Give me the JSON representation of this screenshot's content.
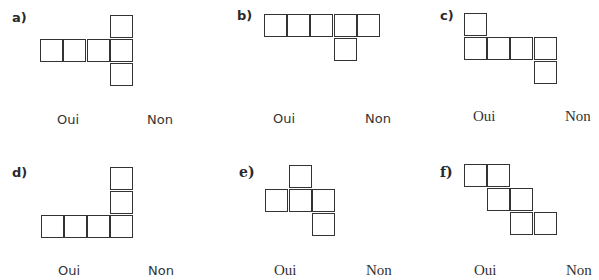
{
  "exercises": [
    {
      "label": "a)",
      "yes": "Oui",
      "no": "Non"
    },
    {
      "label": "b)",
      "yes": "Oui",
      "no": "Non"
    },
    {
      "label": "c)",
      "yes": "Oui",
      "no": "Non"
    },
    {
      "label": "d)",
      "yes": "Oui",
      "no": "Non"
    },
    {
      "label": "e)",
      "yes": "Oui",
      "no": "Non"
    },
    {
      "label": "f)",
      "yes": "Oui",
      "no": "Non"
    }
  ],
  "nets": {
    "a": [
      [
        110,
        15
      ],
      [
        40,
        39
      ],
      [
        63,
        39
      ],
      [
        87,
        39
      ],
      [
        110,
        39
      ],
      [
        110,
        63
      ]
    ],
    "b": [
      [
        264,
        14
      ],
      [
        287,
        14
      ],
      [
        310,
        14
      ],
      [
        334,
        14
      ],
      [
        357,
        14
      ],
      [
        334,
        38
      ]
    ],
    "c": [
      [
        464,
        13
      ],
      [
        464,
        37
      ],
      [
        487,
        37
      ],
      [
        510,
        37
      ],
      [
        534,
        37
      ],
      [
        534,
        61
      ]
    ],
    "d": [
      [
        110,
        167
      ],
      [
        110,
        191
      ],
      [
        41,
        215
      ],
      [
        64,
        215
      ],
      [
        87,
        215
      ],
      [
        110,
        215
      ]
    ],
    "e": [
      [
        289,
        165
      ],
      [
        265,
        189
      ],
      [
        289,
        189
      ],
      [
        312,
        189
      ],
      [
        312,
        213
      ]
    ],
    "f": [
      [
        464,
        164
      ],
      [
        487,
        164
      ],
      [
        487,
        188
      ],
      [
        510,
        188
      ],
      [
        510,
        212
      ],
      [
        534,
        212
      ]
    ]
  }
}
